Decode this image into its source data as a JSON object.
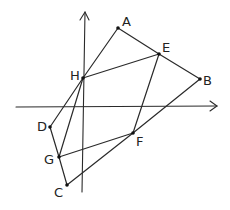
{
  "diagram": {
    "axes": {
      "x_arrow": "right",
      "y_arrow": "up"
    },
    "points": [
      {
        "id": "A",
        "label": "A"
      },
      {
        "id": "B",
        "label": "B"
      },
      {
        "id": "C",
        "label": "C"
      },
      {
        "id": "D",
        "label": "D"
      },
      {
        "id": "E",
        "label": "E"
      },
      {
        "id": "F",
        "label": "F"
      },
      {
        "id": "G",
        "label": "G"
      },
      {
        "id": "H",
        "label": "H"
      }
    ],
    "segments": [
      [
        "A",
        "E"
      ],
      [
        "E",
        "B"
      ],
      [
        "B",
        "F"
      ],
      [
        "F",
        "C"
      ],
      [
        "C",
        "G"
      ],
      [
        "G",
        "D"
      ],
      [
        "D",
        "H"
      ],
      [
        "H",
        "A"
      ],
      [
        "H",
        "E"
      ],
      [
        "E",
        "F"
      ],
      [
        "F",
        "G"
      ],
      [
        "G",
        "H"
      ]
    ],
    "colors": {
      "ink": "#2a2a2a",
      "background": "#ffffff"
    }
  }
}
